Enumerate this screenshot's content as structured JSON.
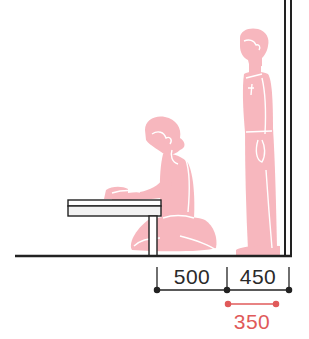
{
  "diagram": {
    "title": "",
    "colors": {
      "figure": "#f7b7be",
      "figure_detail": "#ffffff",
      "line": "#222222",
      "highlight": "#e05a5a"
    },
    "elements": {
      "wall": "wall",
      "floor": "floor",
      "table": "low table",
      "seated_person": "seated person at low table",
      "standing_person": "standing person"
    },
    "dimensions": [
      {
        "id": "seat-to-table",
        "value": "500",
        "unit": "mm",
        "color": "#222222"
      },
      {
        "id": "passage",
        "value": "450",
        "unit": "mm",
        "color": "#222222"
      },
      {
        "id": "min-passage",
        "value": "350",
        "unit": "mm",
        "color": "#e05a5a"
      }
    ]
  }
}
